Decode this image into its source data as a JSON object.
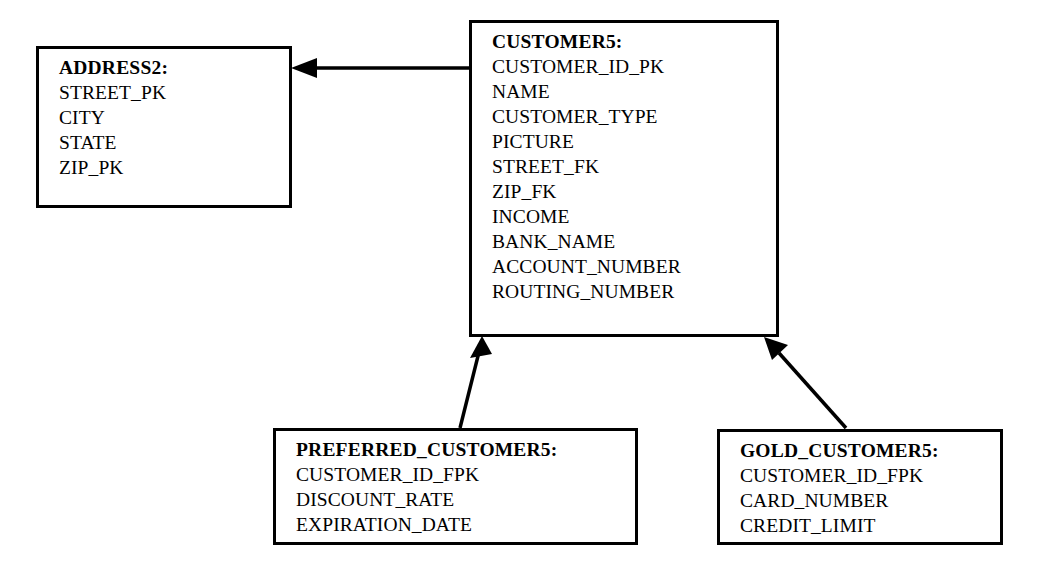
{
  "diagram": {
    "type": "entity-relationship-diagram",
    "background_color": "#ffffff",
    "line_color": "#000000",
    "text_color": "#000000",
    "entities": [
      {
        "id": "address2",
        "title": "ADDRESS2:",
        "attributes": [
          "STREET_PK",
          "CITY",
          "STATE",
          "ZIP_PK"
        ]
      },
      {
        "id": "customer5",
        "title": "CUSTOMER5:",
        "attributes": [
          "CUSTOMER_ID_PK",
          "NAME",
          "CUSTOMER_TYPE",
          "PICTURE",
          "STREET_FK",
          "ZIP_FK",
          "INCOME",
          "BANK_NAME",
          "ACCOUNT_NUMBER",
          "ROUTING_NUMBER"
        ]
      },
      {
        "id": "preferred_customer5",
        "title": "PREFERRED_CUSTOMER5:",
        "attributes": [
          "CUSTOMER_ID_FPK",
          "DISCOUNT_RATE",
          "EXPIRATION_DATE"
        ]
      },
      {
        "id": "gold_customer5",
        "title": "GOLD_CUSTOMER5:",
        "attributes": [
          "CUSTOMER_ID_FPK",
          "CARD_NUMBER",
          "CREDIT_LIMIT"
        ]
      }
    ],
    "relationships": [
      {
        "id": "customer5-to-address2",
        "from": "customer5",
        "to": "address2",
        "style": "solid-line-filled-arrowhead",
        "direction": "horizontal-left"
      },
      {
        "id": "preferred_customer5-to-customer5",
        "from": "preferred_customer5",
        "to": "customer5",
        "style": "solid-line-filled-arrowhead",
        "direction": "diagonal-up-right"
      },
      {
        "id": "gold_customer5-to-customer5",
        "from": "gold_customer5",
        "to": "customer5",
        "style": "solid-line-filled-arrowhead",
        "direction": "diagonal-up-left"
      }
    ]
  }
}
